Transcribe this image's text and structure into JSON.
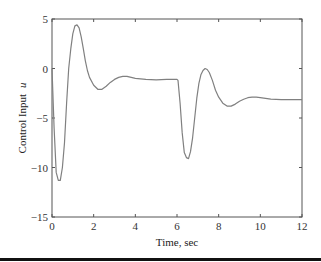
{
  "chart_data": {
    "type": "line",
    "title": "",
    "xlabel": "Time, sec",
    "ylabel": "Control Input",
    "ylabel_var": "u",
    "xlim": [
      0,
      12
    ],
    "ylim": [
      -15,
      5
    ],
    "xticks": [
      0,
      2,
      4,
      6,
      8,
      10,
      12
    ],
    "yticks": [
      5,
      0,
      -5,
      -10,
      -15
    ],
    "grid": false,
    "legend": null,
    "series": [
      {
        "name": "u",
        "color": "#808080",
        "x": [
          0,
          0.1,
          0.2,
          0.3,
          0.4,
          0.5,
          0.6,
          0.7,
          0.8,
          0.9,
          1.0,
          1.1,
          1.2,
          1.3,
          1.4,
          1.5,
          1.6,
          1.7,
          1.8,
          2.0,
          2.2,
          2.4,
          2.6,
          2.8,
          3.0,
          3.2,
          3.4,
          3.6,
          3.8,
          4.0,
          4.5,
          5.0,
          5.5,
          6.0,
          6.05,
          6.15,
          6.25,
          6.35,
          6.45,
          6.55,
          6.65,
          6.75,
          6.85,
          6.95,
          7.05,
          7.15,
          7.25,
          7.35,
          7.45,
          7.55,
          7.7,
          7.85,
          8.0,
          8.2,
          8.4,
          8.6,
          8.8,
          9.0,
          9.2,
          9.4,
          9.6,
          9.8,
          10.0,
          10.5,
          11.0,
          11.5,
          12.0
        ],
        "y": [
          0,
          -6.0,
          -10.5,
          -11.3,
          -11.3,
          -10.0,
          -7.5,
          -3.5,
          0.0,
          2.0,
          3.5,
          4.3,
          4.4,
          4.1,
          3.2,
          2.0,
          0.8,
          -0.2,
          -0.9,
          -1.7,
          -2.1,
          -2.1,
          -1.8,
          -1.4,
          -1.1,
          -0.9,
          -0.8,
          -0.8,
          -0.9,
          -1.0,
          -1.1,
          -1.15,
          -1.1,
          -1.1,
          -1.2,
          -3.5,
          -6.5,
          -8.5,
          -9.0,
          -9.1,
          -8.4,
          -7.0,
          -5.0,
          -3.0,
          -1.5,
          -0.6,
          -0.2,
          0.0,
          -0.1,
          -0.4,
          -1.2,
          -2.2,
          -2.9,
          -3.5,
          -3.8,
          -3.8,
          -3.6,
          -3.3,
          -3.1,
          -2.95,
          -2.9,
          -2.9,
          -2.95,
          -3.1,
          -3.15,
          -3.15,
          -3.15
        ]
      }
    ]
  },
  "axes": {
    "x_tick_labels": [
      "0",
      "2",
      "4",
      "6",
      "8",
      "10",
      "12"
    ],
    "y_tick_labels": [
      "5",
      "0",
      "−5",
      "−10",
      "−15"
    ],
    "xlabel": "Time, sec",
    "ylabel": "Control Input",
    "ylabel_var": "u"
  }
}
